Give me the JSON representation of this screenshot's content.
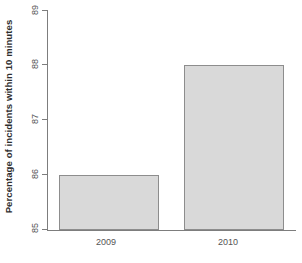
{
  "chart_data": {
    "type": "bar",
    "title": "",
    "subtitle": "",
    "xlabel": "",
    "ylabel": "Percentage of incidents within 10 minutes",
    "categories": [
      "2009",
      "2010"
    ],
    "values": [
      86,
      88
    ],
    "series": [
      {
        "name": "Percentage of incidents within 10 minutes",
        "values": [
          86,
          88
        ]
      }
    ],
    "ylim": [
      85,
      89
    ],
    "yticks": [
      85,
      86,
      87,
      88,
      89
    ],
    "ytick_labels": [
      "85",
      "86",
      "87",
      "88",
      "89"
    ],
    "xtick_labels": [
      "2009",
      "2010"
    ],
    "grid": false,
    "legend": false,
    "legend_position": "none",
    "annotations": [],
    "colors": {
      "bar_fill": "#d9d9d9",
      "bar_border": "#8d8d8d",
      "axis": "#7d7d7d",
      "tick_label": "#555555",
      "axis_title": "#2e2e2e",
      "background": "#ffffff"
    }
  }
}
